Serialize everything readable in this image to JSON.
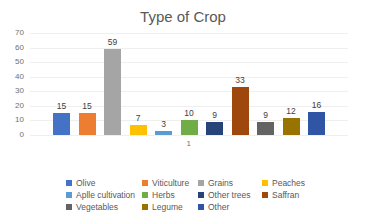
{
  "chart_data": {
    "type": "bar",
    "title": "Type of Crop",
    "xlabel": "",
    "ylabel": "",
    "ylim": [
      0,
      70
    ],
    "yticks": [
      0,
      10,
      20,
      30,
      40,
      50,
      60,
      70
    ],
    "categories": [
      "1"
    ],
    "grid": true,
    "legend_position": "bottom",
    "series": [
      {
        "name": "Olive",
        "values": [
          15
        ],
        "color": "#4472C4"
      },
      {
        "name": "Viticulture",
        "values": [
          15
        ],
        "color": "#ED7D31"
      },
      {
        "name": "Grains",
        "values": [
          59
        ],
        "color": "#A5A5A5"
      },
      {
        "name": "Peaches",
        "values": [
          7
        ],
        "color": "#FFC000"
      },
      {
        "name": "Aplle cultivation",
        "values": [
          3
        ],
        "color": "#5B9BD5"
      },
      {
        "name": "Herbs",
        "values": [
          10
        ],
        "color": "#70AD47"
      },
      {
        "name": "Other trees",
        "values": [
          9
        ],
        "color": "#264478"
      },
      {
        "name": "Saffran",
        "values": [
          33
        ],
        "color": "#9E480E"
      },
      {
        "name": "Vegetables",
        "values": [
          9
        ],
        "color": "#636363"
      },
      {
        "name": "Legume",
        "values": [
          12
        ],
        "color": "#997300"
      },
      {
        "name": "Other",
        "values": [
          16
        ],
        "color": "#2F55A4"
      }
    ]
  },
  "x_tick_label": "1",
  "legend_rows": [
    [
      "Olive",
      "Viticulture",
      "Grains",
      "Peaches"
    ],
    [
      "Aplle cultivation",
      "Herbs",
      "Other trees",
      "Saffran"
    ],
    [
      "Vegetables",
      "Legume",
      "Other"
    ]
  ]
}
